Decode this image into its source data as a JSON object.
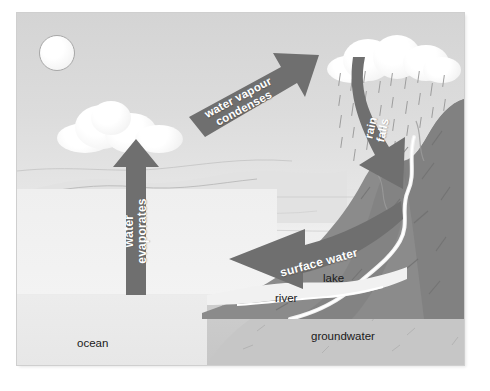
{
  "diagram": {
    "type": "water-cycle-illustration",
    "palette": {
      "arrow_fill": "#6f6f6f",
      "arrow_text": "#ffffff",
      "sky": "#d8d8d8",
      "sea": "#ebebeb",
      "mountain": "#8b8b8b",
      "mountain_dark": "#7a7a7a",
      "ground": "#c9c9c9",
      "label_text": "#1a1a1a",
      "frame_bg": "#d6d6d6"
    },
    "arrows": [
      {
        "id": "evaporation",
        "label": "water evaporates",
        "line1": "water",
        "line2": "evaporates",
        "direction": "up",
        "color": "#6f6f6f"
      },
      {
        "id": "condensation",
        "label": "water vapour condenses",
        "line1": "water vapour",
        "line2": "condenses",
        "direction": "up-right",
        "color": "#6f6f6f"
      },
      {
        "id": "precipitation",
        "label": "rain falls",
        "line1": "rain",
        "line2": "falls",
        "direction": "down",
        "color": "#6f6f6f"
      },
      {
        "id": "runoff",
        "label": "surface water",
        "line1": "surface water",
        "line2": "",
        "direction": "left",
        "color": "#6f6f6f"
      }
    ],
    "labels": [
      {
        "id": "ocean",
        "text": "ocean"
      },
      {
        "id": "lake",
        "text": "lake"
      },
      {
        "id": "river",
        "text": "river"
      },
      {
        "id": "groundwater",
        "text": "groundwater"
      }
    ],
    "features": [
      {
        "id": "sun",
        "name": "sun"
      },
      {
        "id": "cloud-left",
        "name": "cloud"
      },
      {
        "id": "cloud-right",
        "name": "rain-cloud"
      },
      {
        "id": "mountain",
        "name": "mountain"
      },
      {
        "id": "rain",
        "name": "rainfall"
      },
      {
        "id": "stream",
        "name": "mountain-stream"
      }
    ]
  }
}
